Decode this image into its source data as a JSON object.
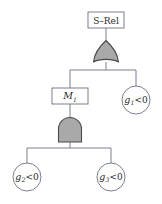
{
  "diagram": {
    "type": "fault-tree",
    "background_color": "#ffffff",
    "stroke_color": "#6b7280",
    "gate_fill_color": "#a9a9a9",
    "gate_stroke_color": "#4a4a4a",
    "text_color": "#2b2b2b",
    "top_event": {
      "label": "S–Rel",
      "shape": "rectangle"
    },
    "intermediate_event": {
      "label_base": "M",
      "label_sub": "1",
      "shape": "rectangle"
    },
    "gates": [
      {
        "name": "or-gate",
        "type": "OR",
        "symbol_shape": "pointed-apex-curved-base"
      },
      {
        "name": "and-gate",
        "type": "AND",
        "symbol_shape": "rounded-top-flat-base"
      }
    ],
    "basic_events": [
      {
        "name": "basic-event-g1",
        "base": "g",
        "sub": "1",
        "relation": "<0",
        "shape": "circle"
      },
      {
        "name": "basic-event-g2",
        "base": "g",
        "sub": "2",
        "relation": "<0",
        "shape": "circle"
      },
      {
        "name": "basic-event-g3",
        "base": "g",
        "sub": "3",
        "relation": "<0",
        "shape": "circle"
      }
    ]
  }
}
